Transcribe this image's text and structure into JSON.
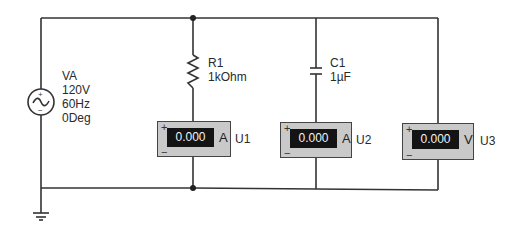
{
  "colors": {
    "wire": "#333333",
    "meter_body": "#c9c9c9",
    "meter_display": "#141414",
    "display_text": "#f2f2f2"
  },
  "source": {
    "name": "VA",
    "voltage": "120V",
    "frequency": "60Hz",
    "phase": "0Deg",
    "plus": "+",
    "minus": "−"
  },
  "resistor": {
    "name": "R1",
    "value": "1kOhm"
  },
  "capacitor": {
    "name": "C1",
    "value": "1µF"
  },
  "meters": [
    {
      "name": "U1",
      "reading": "0.000",
      "unit": "A",
      "plus": "+",
      "minus": "−"
    },
    {
      "name": "U2",
      "reading": "0.000",
      "unit": "A",
      "plus": "+",
      "minus": "−"
    },
    {
      "name": "U3",
      "reading": "0.000",
      "unit": "V",
      "plus": "+",
      "minus": "−"
    }
  ]
}
